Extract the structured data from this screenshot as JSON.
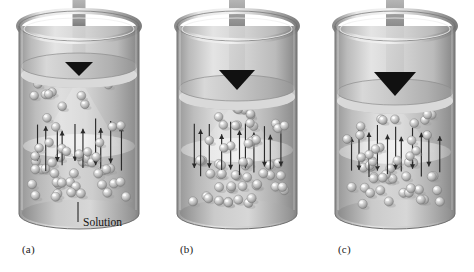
{
  "figure": {
    "background_color": "#ffffff",
    "width": 474,
    "height": 272
  },
  "callout": {
    "label": "Solution",
    "target": "solution-body"
  },
  "colors": {
    "cylinder_wall_light": "#e3e3e3",
    "cylinder_wall_mid": "#b8b8b8",
    "cylinder_wall_dark": "#8f8f8f",
    "cylinder_outline": "#6e6e6e",
    "solution_light": "#d2d2d2",
    "solution_dark": "#a9a9a9",
    "interface_band": "#e8e8e8",
    "piston_top": "#c9c9c9",
    "piston_edge": "#9a9a9a",
    "pressure_arrow_dark": "#111111",
    "pressure_arrow_light": "#b5b5b5",
    "particle_body": "#c4c4c4",
    "particle_highlight": "#f2f2f2",
    "particle_shadow": "#8a8a8a",
    "flow_arrow": "#2a2a2a",
    "text": "#141414"
  },
  "panels": [
    {
      "id": "a",
      "label": "(a)",
      "label_x": 22,
      "label_y": 243,
      "x": 10,
      "pressure_arrow": {
        "name": "applied-pressure-arrow",
        "stem_width": 13,
        "head_width": 28,
        "head_height": 14,
        "stem_top": 0,
        "tip_y": 76,
        "size": "small",
        "description": "small applied pressure"
      },
      "piston": {
        "y": 66,
        "thickness": 9,
        "description": "piston high in cylinder"
      },
      "interface_y": 146,
      "particles": {
        "dilute_count": 22,
        "concentrated_count": 34,
        "description": "upper dilute region, lower concentrated region"
      },
      "flow_arrows": {
        "up_count": 5,
        "down_count": 5,
        "description": "equal solvent flow up and down - equilibrium"
      }
    },
    {
      "id": "b",
      "label": "(b)",
      "label_x": 180,
      "label_y": 243,
      "x": 168,
      "pressure_arrow": {
        "name": "applied-pressure-arrow",
        "stem_width": 16,
        "head_width": 36,
        "head_height": 20,
        "stem_top": 0,
        "tip_y": 90,
        "size": "medium",
        "description": "larger applied pressure"
      },
      "piston": {
        "y": 88,
        "thickness": 9,
        "description": "piston pushed lower"
      },
      "interface_y": 150,
      "particles": {
        "dilute_count": 24,
        "concentrated_count": 36,
        "description": "upper dilute region, lower concentrated region"
      },
      "flow_arrows": {
        "up_count": 4,
        "down_count": 7,
        "description": "net downward solvent flow"
      }
    },
    {
      "id": "c",
      "label": "(c)",
      "label_x": 338,
      "label_y": 243,
      "x": 326,
      "pressure_arrow": {
        "name": "applied-pressure-arrow",
        "stem_width": 18,
        "head_width": 42,
        "head_height": 24,
        "stem_top": 0,
        "tip_y": 96,
        "size": "large",
        "description": "largest applied pressure"
      },
      "piston": {
        "y": 92,
        "thickness": 9,
        "description": "piston pushed lowest"
      },
      "interface_y": 152,
      "particles": {
        "dilute_count": 20,
        "concentrated_count": 32,
        "description": "upper dilute region, lower concentrated region"
      },
      "flow_arrows": {
        "up_count": 6,
        "down_count": 5,
        "description": "net upward solvent flow - reverse osmosis"
      }
    }
  ]
}
